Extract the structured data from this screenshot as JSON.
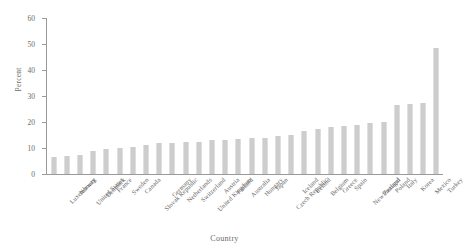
{
  "chart_data": {
    "type": "bar",
    "title": "",
    "xlabel": "Country",
    "ylabel": "Percent",
    "ylim": [
      0,
      60
    ],
    "yticks": [
      0,
      10,
      20,
      30,
      40,
      50,
      60
    ],
    "grid": false,
    "legend": null,
    "bar_color": "#cdcdcd",
    "axis_color": "#9a9a9a",
    "text_color": "#6a6a6a",
    "categories": [
      "Luxembourg",
      "Norway",
      "United States",
      "Denmark",
      "France",
      "Sweden",
      "Canada",
      "Slovak Republic",
      "Germany",
      "Netherlands",
      "Switzerland",
      "United Kingdom",
      "Austria",
      "Finland",
      "Australia",
      "Hungary",
      "Japan",
      "Czech Republic",
      "Iceland",
      "Ireland",
      "Belgium",
      "Greece",
      "Spain",
      "New Zealand",
      "Portugal",
      "Poland",
      "Italy",
      "Korea",
      "Mexico",
      "Turkey"
    ],
    "values": [
      6.5,
      7.0,
      7.5,
      9.0,
      9.5,
      10.0,
      10.5,
      11.0,
      12.0,
      12.0,
      12.5,
      12.5,
      13.0,
      13.0,
      13.5,
      14.0,
      14.0,
      14.5,
      15.0,
      16.5,
      17.5,
      18.0,
      18.5,
      19.0,
      19.5,
      20.0,
      26.5,
      27.0,
      27.5,
      48.5
    ],
    "values_long": [
      {
        "category": "Luxembourg",
        "value": 6.5
      },
      {
        "category": "Norway",
        "value": 7.0
      },
      {
        "category": "United States",
        "value": 7.5
      },
      {
        "category": "Denmark",
        "value": 9.0
      },
      {
        "category": "France",
        "value": 9.5
      },
      {
        "category": "Sweden",
        "value": 10.0
      },
      {
        "category": "Canada",
        "value": 10.5
      },
      {
        "category": "Slovak Republic",
        "value": 11.0
      },
      {
        "category": "Germany",
        "value": 12.0
      },
      {
        "category": "Netherlands",
        "value": 12.0
      },
      {
        "category": "Switzerland",
        "value": 12.5
      },
      {
        "category": "United Kingdom",
        "value": 12.5
      },
      {
        "category": "Austria",
        "value": 13.0
      },
      {
        "category": "Finland",
        "value": 13.0
      },
      {
        "category": "Australia",
        "value": 13.5
      },
      {
        "category": "Hungary",
        "value": 14.0
      },
      {
        "category": "Japan",
        "value": 14.0
      },
      {
        "category": "Czech Republic",
        "value": 14.5
      },
      {
        "category": "Iceland",
        "value": 15.0
      },
      {
        "category": "Ireland",
        "value": 16.5
      },
      {
        "category": "Belgium",
        "value": 17.5
      },
      {
        "category": "Greece",
        "value": 18.0
      },
      {
        "category": "Spain",
        "value": 18.5
      },
      {
        "category": "New Zealand",
        "value": 19.0
      },
      {
        "category": "Portugal",
        "value": 19.5
      },
      {
        "category": "Poland",
        "value": 20.0
      },
      {
        "category": "Italy",
        "value": 26.5
      },
      {
        "category": "Korea",
        "value": 27.0
      },
      {
        "category": "Mexico",
        "value": 27.5
      },
      {
        "category": "Turkey",
        "value": 48.5
      }
    ]
  }
}
